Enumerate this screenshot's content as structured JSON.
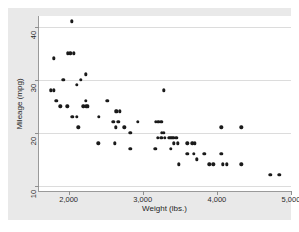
{
  "window": {
    "background_color": "#ffffff",
    "graph_background_color": "#e9e9e9",
    "plot_background_color": "#ffffff",
    "caption_remnant": ""
  },
  "chart_data": {
    "type": "scatter",
    "title": "",
    "xlabel": "Weight (lbs.)",
    "ylabel": "Mileage (mpg)",
    "xlim": [
      1600,
      5000
    ],
    "ylim": [
      9,
      42
    ],
    "xticks": [
      2000,
      3000,
      4000,
      5000
    ],
    "xticklabels": [
      "2,000",
      "3,000",
      "4,000",
      "5,000"
    ],
    "yticks": [
      10,
      20,
      30,
      40
    ],
    "yticklabels": [
      "10",
      "20",
      "30",
      "40"
    ],
    "grid": "horizontal",
    "legend": "none",
    "marker_color": "#1a1a1a",
    "marker_size": 3.4,
    "series": [
      {
        "name": "Mileage vs Weight",
        "points": [
          [
            2040,
            41
          ],
          [
            1800,
            34
          ],
          [
            2020,
            35
          ],
          [
            2070,
            35
          ],
          [
            1930,
            30
          ],
          [
            2110,
            29
          ],
          [
            2230,
            31
          ],
          [
            1760,
            28
          ],
          [
            1800,
            28
          ],
          [
            1830,
            26
          ],
          [
            1890,
            25
          ],
          [
            1980,
            25
          ],
          [
            2240,
            25
          ],
          [
            2260,
            25
          ],
          [
            2230,
            26
          ],
          [
            2050,
            23
          ],
          [
            2110,
            23
          ],
          [
            2130,
            21
          ],
          [
            2410,
            23
          ],
          [
            2520,
            26
          ],
          [
            2650,
            24
          ],
          [
            2690,
            24
          ],
          [
            2670,
            22
          ],
          [
            2600,
            22
          ],
          [
            2750,
            21
          ],
          [
            2640,
            21
          ],
          [
            2830,
            20
          ],
          [
            2930,
            22
          ],
          [
            3180,
            22
          ],
          [
            3250,
            22
          ],
          [
            3280,
            28
          ],
          [
            3260,
            20
          ],
          [
            3250,
            19
          ],
          [
            3200,
            19
          ],
          [
            3350,
            19
          ],
          [
            3400,
            19
          ],
          [
            3420,
            19
          ],
          [
            3450,
            19
          ],
          [
            3170,
            17
          ],
          [
            3380,
            17
          ],
          [
            3420,
            18
          ],
          [
            3470,
            18
          ],
          [
            3600,
            18
          ],
          [
            3670,
            18
          ],
          [
            3700,
            18
          ],
          [
            2400,
            18
          ],
          [
            2620,
            18
          ],
          [
            2830,
            17
          ],
          [
            3490,
            14
          ],
          [
            3600,
            16
          ],
          [
            3690,
            16
          ],
          [
            3730,
            15
          ],
          [
            3830,
            16
          ],
          [
            3900,
            14
          ],
          [
            3950,
            14
          ],
          [
            4060,
            16
          ],
          [
            4080,
            14
          ],
          [
            4130,
            14
          ],
          [
            4060,
            21
          ],
          [
            4330,
            21
          ],
          [
            4330,
            14
          ],
          [
            4720,
            12
          ],
          [
            4840,
            12
          ],
          [
            1990,
            35
          ],
          [
            2160,
            30
          ],
          [
            2200,
            25
          ],
          [
            3300,
            19
          ],
          [
            3370,
            19
          ],
          [
            3280,
            20
          ],
          [
            3210,
            22
          ],
          [
            2640,
            24
          ],
          [
            1840,
            26
          ]
        ]
      }
    ]
  }
}
